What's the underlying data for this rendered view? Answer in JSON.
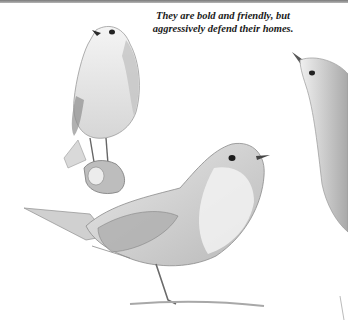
{
  "illustration": {
    "subject": "pencil sketches of European robins",
    "caption_lines": [
      "They are bold and friendly, but",
      "aggressively defend their homes."
    ],
    "figures": [
      "robin-perched-looking-up",
      "robin-standing-side-view",
      "robin-partial-right-edge"
    ]
  },
  "colors": {
    "background": "#ffffff",
    "rule": "#8a8a8a",
    "pencil": "#6e6e6e"
  }
}
